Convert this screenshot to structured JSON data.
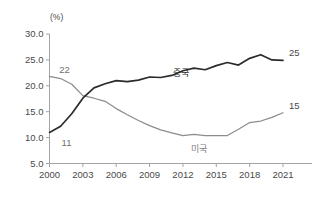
{
  "chart_data": {
    "type": "line",
    "title": "",
    "subtitle": "",
    "unit_label": "(%)",
    "xlabel": "",
    "ylabel": "",
    "grid": false,
    "legend_position": "inline-annotation",
    "xlim": [
      2000,
      2021
    ],
    "ylim": [
      5.0,
      30.0
    ],
    "x": [
      2000,
      2001,
      2002,
      2003,
      2004,
      2005,
      2006,
      2007,
      2008,
      2009,
      2010,
      2011,
      2012,
      2013,
      2014,
      2015,
      2016,
      2017,
      2018,
      2019,
      2020,
      2021
    ],
    "x_tick_labels": [
      "2000",
      "2003",
      "2006",
      "2009",
      "2012",
      "2015",
      "2018",
      "2021"
    ],
    "x_ticks": [
      2000,
      2003,
      2006,
      2009,
      2012,
      2015,
      2018,
      2021
    ],
    "y_ticks": [
      5.0,
      10.0,
      15.0,
      20.0,
      25.0,
      30.0
    ],
    "y_tick_labels": [
      "5.0",
      "10.0",
      "15.0",
      "20.0",
      "25.0",
      "30.0"
    ],
    "series": [
      {
        "name": "중국",
        "color": "#2b2b2b",
        "start_label": "11",
        "end_label": "25",
        "values": [
          11.0,
          12.2,
          14.6,
          17.6,
          19.6,
          20.4,
          21.0,
          20.8,
          21.1,
          21.7,
          21.6,
          22.0,
          22.9,
          23.4,
          23.1,
          23.9,
          24.5,
          24.0,
          25.3,
          26.0,
          25.0,
          24.9
        ]
      },
      {
        "name": "미국",
        "color": "#8c8c8c",
        "start_label": "22",
        "end_label": "15",
        "values": [
          21.8,
          21.4,
          20.3,
          18.1,
          17.6,
          17.0,
          15.6,
          14.4,
          13.3,
          12.3,
          11.5,
          10.9,
          10.4,
          10.6,
          10.4,
          10.4,
          10.4,
          11.6,
          12.9,
          13.2,
          13.9,
          14.8
        ]
      }
    ],
    "annotations": [
      {
        "text": "22",
        "series": "미국",
        "kind": "start-value"
      },
      {
        "text": "11",
        "series": "중국",
        "kind": "start-value"
      },
      {
        "text": "25",
        "series": "중국",
        "kind": "end-value"
      },
      {
        "text": "15",
        "series": "미국",
        "kind": "end-value"
      }
    ]
  }
}
